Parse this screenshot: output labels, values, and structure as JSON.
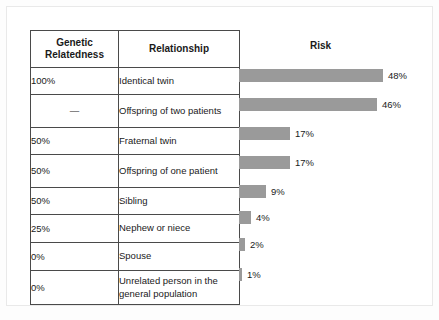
{
  "figure": {
    "table_headers": {
      "relatedness": "Genetic\nRelatedness",
      "relatedness_line1": "Genetic",
      "relatedness_line2": "Relatedness",
      "relationship": "Relationship",
      "risk": "Risk"
    },
    "rows": [
      {
        "relatedness": "100%",
        "relationship": "Identical twin",
        "risk_label": "48%",
        "risk_value": 48
      },
      {
        "relatedness": "—",
        "relationship": "Offspring of two patients",
        "risk_label": "46%",
        "risk_value": 46
      },
      {
        "relatedness": "50%",
        "relationship": "Fraternal twin",
        "risk_label": "17%",
        "risk_value": 17
      },
      {
        "relatedness": "50%",
        "relationship": "Offspring of one patient",
        "risk_label": "17%",
        "risk_value": 17
      },
      {
        "relatedness": "50%",
        "relationship": "Sibling",
        "risk_label": "9%",
        "risk_value": 9
      },
      {
        "relatedness": "25%",
        "relationship": "Nephew or niece",
        "risk_label": "4%",
        "risk_value": 4
      },
      {
        "relatedness": "0%",
        "relationship": "Spouse",
        "risk_label": "2%",
        "risk_value": 2
      },
      {
        "relatedness": "0%",
        "relationship": "Unrelated person in the general population",
        "risk_label": "1%",
        "risk_value": 1
      }
    ]
  },
  "chart_data": {
    "type": "bar",
    "title": "Risk",
    "orientation": "horizontal",
    "categories": [
      "Identical twin",
      "Offspring of two patients",
      "Fraternal twin",
      "Offspring of one patient",
      "Sibling",
      "Nephew or niece",
      "Spouse",
      "Unrelated person in the general population"
    ],
    "values": [
      48,
      46,
      17,
      17,
      9,
      4,
      2,
      1
    ],
    "data_labels": [
      "48%",
      "46%",
      "17%",
      "17%",
      "9%",
      "4%",
      "2%",
      "1%"
    ],
    "secondary_categories": [
      "100%",
      "—",
      "50%",
      "50%",
      "50%",
      "25%",
      "0%",
      "0%"
    ],
    "secondary_label": "Genetic Relatedness",
    "xlabel": "",
    "ylabel": "",
    "xlim": [
      0,
      50
    ],
    "grid": false,
    "legend": "none",
    "bar_color": "#9a9a9a",
    "units": "percent"
  }
}
